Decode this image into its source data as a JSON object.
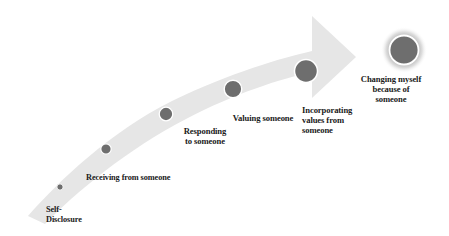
{
  "diagram": {
    "type": "ascending-curved-arrow-progression",
    "title": "",
    "background_color": "#ffffff",
    "arrow": {
      "name": "progression-arrow",
      "fill_color": "#e6e6e6",
      "direction": "upward-right",
      "description": "Tapered curved band rising from lower-left to a rightward arrowhead at upper-right"
    },
    "node_style": {
      "fill_color": "#6e6e6e",
      "ring_color": "#ffffff",
      "glow_color": "#b4b4b4"
    },
    "text_color": "#1a1a1a",
    "stages": [
      {
        "index": 1,
        "label": "Self-\nDisclosure",
        "cx": 60,
        "cy": 187,
        "r": 3.2,
        "highlighted": false
      },
      {
        "index": 2,
        "label": "Receiving from someone",
        "cx": 106,
        "cy": 149,
        "r": 5.2,
        "highlighted": false
      },
      {
        "index": 3,
        "label": "Responding\nto someone",
        "cx": 166,
        "cy": 114,
        "r": 6.8,
        "highlighted": false
      },
      {
        "index": 4,
        "label": "Valuing someone",
        "cx": 233,
        "cy": 89,
        "r": 8.8,
        "highlighted": false
      },
      {
        "index": 5,
        "label": "Incorporating\nvalues from\nsomeone",
        "cx": 306,
        "cy": 71,
        "r": 11.5,
        "highlighted": false
      },
      {
        "index": 6,
        "label": "Changing myself\nbecause of\nsomeone",
        "cx": 404,
        "cy": 50,
        "r": 14.5,
        "highlighted": true
      }
    ]
  }
}
